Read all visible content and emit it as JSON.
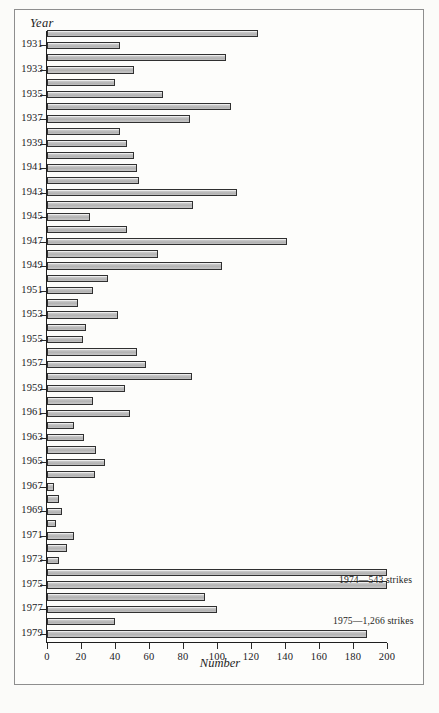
{
  "figure": {
    "axis_title_y": "Year",
    "axis_title_x": "Number",
    "annotations": [
      {
        "text": "1974—543 strikes",
        "x_px": 338,
        "y_px": 573
      },
      {
        "text": "1975—1,266 strikes",
        "x_px": 332,
        "y_px": 614
      }
    ]
  },
  "chart_data": {
    "type": "bar",
    "orientation": "horizontal",
    "title": "",
    "xlabel": "Number",
    "ylabel": "Year",
    "xlim": [
      0,
      200
    ],
    "x_ticks": [
      0,
      20,
      40,
      60,
      80,
      100,
      120,
      140,
      160,
      180,
      200
    ],
    "x_tick_labels": [
      "0",
      "20",
      "40",
      "60",
      "80",
      "100",
      "120",
      "140",
      "160",
      "180",
      "200"
    ],
    "grid": false,
    "legend": "none",
    "y_tick_labels": [
      "1931",
      "1933",
      "1935",
      "1937",
      "1939",
      "1941",
      "1943",
      "1945",
      "1947",
      "1949",
      "1951",
      "1953",
      "1955",
      "1957",
      "1959",
      "1961",
      "1963",
      "1965",
      "1967",
      "1969",
      "1971",
      "1973",
      "1975",
      "1977",
      "1979"
    ],
    "categories": [
      1930,
      1931,
      1932,
      1933,
      1934,
      1935,
      1936,
      1937,
      1938,
      1939,
      1940,
      1941,
      1942,
      1943,
      1944,
      1945,
      1946,
      1947,
      1948,
      1949,
      1950,
      1951,
      1952,
      1953,
      1954,
      1955,
      1956,
      1957,
      1958,
      1959,
      1960,
      1961,
      1962,
      1963,
      1964,
      1965,
      1966,
      1967,
      1968,
      1969,
      1970,
      1971,
      1972,
      1973,
      1974,
      1975,
      1976,
      1977,
      1978,
      1979
    ],
    "values": [
      124,
      43,
      105,
      51,
      40,
      68,
      108,
      84,
      43,
      47,
      51,
      53,
      54,
      112,
      86,
      25,
      47,
      141,
      65,
      103,
      36,
      27,
      18,
      42,
      23,
      21,
      53,
      58,
      85,
      46,
      27,
      49,
      16,
      22,
      29,
      34,
      28,
      4,
      7,
      9,
      5,
      16,
      12,
      7,
      200,
      200,
      93,
      100,
      40,
      188
    ],
    "truncated_bars": [
      {
        "year": 1974,
        "actual_value": 543,
        "note": "bar extends beyond axis maximum"
      },
      {
        "year": 1975,
        "actual_value": 1266,
        "note": "bar extends beyond axis maximum"
      }
    ]
  }
}
